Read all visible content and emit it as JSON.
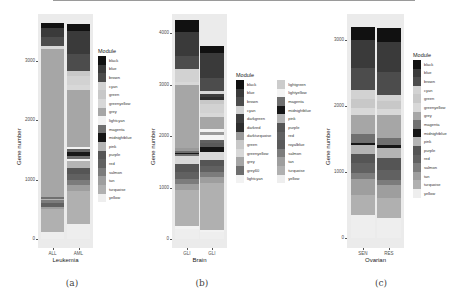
{
  "colors": {
    "black": "#111111",
    "blue": "#3a3a3a",
    "brown": "#4c4c4c",
    "cyan": "#d2d2d2",
    "darkgreen": "#3e3e3e",
    "darkred": "#2e2e2e",
    "darkturquoise": "#9a9a9a",
    "green": "#c8c8c8",
    "greenyellow": "#d8d8d8",
    "grey": "#a6a6a6",
    "grey60": "#6e6e6e",
    "lightcyan": "#f2f2f2",
    "lightgreen": "#cccccc",
    "lightyellow": "#f4f4f4",
    "magenta": "#707070",
    "midnightblue": "#161616",
    "pink": "#b4b4b4",
    "purple": "#555555",
    "red": "#616161",
    "royalblue": "#5a5a5a",
    "salmon": "#7c7c7c",
    "tan": "#9e9e9e",
    "turquoise": "#b0b0b0",
    "yellow": "#eeeeee"
  },
  "captions": [
    "(a)",
    "(b)",
    "(c)"
  ],
  "chart_data": [
    {
      "type": "bar",
      "stacked": true,
      "title": "",
      "xlabel": "Leukemia",
      "ylabel": "Gene number",
      "categories": [
        "ALL",
        "AML"
      ],
      "yticks": [
        0,
        1000,
        2000,
        3000
      ],
      "ylim": [
        -170,
        3800
      ],
      "legend_title": "Module",
      "legend": [
        "black",
        "blue",
        "brown",
        "cyan",
        "green",
        "greenyellow",
        "grey",
        "lightcyan",
        "magenta",
        "midnightblue",
        "pink",
        "purple",
        "red",
        "salmon",
        "tan",
        "turquoise",
        "yellow"
      ],
      "series_bottom_up": {
        "ALL": [
          {
            "module": "yellow",
            "value": 110
          },
          {
            "module": "turquoise",
            "value": 390
          },
          {
            "module": "tan",
            "value": 40
          },
          {
            "module": "red",
            "value": 70
          },
          {
            "module": "salmon",
            "value": 40
          },
          {
            "module": "pink",
            "value": 30
          },
          {
            "module": "magenta",
            "value": 20
          },
          {
            "module": "grey",
            "value": 2500
          },
          {
            "module": "greenyellow",
            "value": 50
          },
          {
            "module": "brown",
            "value": 150
          },
          {
            "module": "blue",
            "value": 150
          },
          {
            "module": "black",
            "value": 80
          }
        ],
        "AML": [
          {
            "module": "yellow",
            "value": 250
          },
          {
            "module": "turquoise",
            "value": 550
          },
          {
            "module": "tan",
            "value": 100
          },
          {
            "module": "salmon",
            "value": 100
          },
          {
            "module": "red",
            "value": 100
          },
          {
            "module": "purple",
            "value": 100
          },
          {
            "module": "pink",
            "value": 110
          },
          {
            "module": "lightcyan",
            "value": 30
          },
          {
            "module": "magenta",
            "value": 60
          },
          {
            "module": "midnightblue",
            "value": 60
          },
          {
            "module": "red",
            "value": 60
          },
          {
            "module": "lightcyan",
            "value": 30
          },
          {
            "module": "grey",
            "value": 950
          },
          {
            "module": "greenyellow",
            "value": 90
          },
          {
            "module": "cyan",
            "value": 150
          },
          {
            "module": "green",
            "value": 80
          },
          {
            "module": "brown",
            "value": 290
          },
          {
            "module": "blue",
            "value": 380
          },
          {
            "module": "black",
            "value": 130
          }
        ]
      }
    },
    {
      "type": "bar",
      "stacked": true,
      "title": "",
      "xlabel": "Brain",
      "ylabel": "Gene number",
      "categories": [
        "GLI",
        "GLI"
      ],
      "yticks": [
        0,
        1000,
        2000,
        3000,
        4000
      ],
      "ylim": [
        -120,
        4450
      ],
      "legend_title": "Module",
      "legend": [
        "black",
        "blue",
        "brown",
        "cyan",
        "darkgreen",
        "darkred",
        "darkturquoise",
        "green",
        "greenyellow",
        "grey",
        "grey60",
        "lightcyan",
        "lightgreen",
        "lightyellow",
        "magenta",
        "midnightblue",
        "pink",
        "purple",
        "red",
        "royalblue",
        "salmon",
        "tan",
        "turquoise",
        "yellow"
      ],
      "series_bottom_up": {
        "GLI_1": [
          {
            "module": "yellow",
            "value": 200
          },
          {
            "module": "lightcyan",
            "value": 60
          },
          {
            "module": "turquoise",
            "value": 700
          },
          {
            "module": "tan",
            "value": 100
          },
          {
            "module": "salmon",
            "value": 100
          },
          {
            "module": "red",
            "value": 150
          },
          {
            "module": "purple",
            "value": 150
          },
          {
            "module": "greenyellow",
            "value": 150
          },
          {
            "module": "magenta",
            "value": 40
          },
          {
            "module": "midnightblue",
            "value": 30
          },
          {
            "module": "grey60",
            "value": 40
          },
          {
            "module": "darkturquoise",
            "value": 50
          },
          {
            "module": "grey",
            "value": 1230
          },
          {
            "module": "greenyellow",
            "value": 60
          },
          {
            "module": "cyan",
            "value": 250
          },
          {
            "module": "brown",
            "value": 250
          },
          {
            "module": "blue",
            "value": 470
          },
          {
            "module": "black",
            "value": 220
          }
        ],
        "GLI_2": [
          {
            "module": "yellow",
            "value": 140
          },
          {
            "module": "lightcyan",
            "value": 40
          },
          {
            "module": "turquoise",
            "value": 900
          },
          {
            "module": "tan",
            "value": 120
          },
          {
            "module": "salmon",
            "value": 100
          },
          {
            "module": "red",
            "value": 120
          },
          {
            "module": "purple",
            "value": 120
          },
          {
            "module": "greenyellow",
            "value": 160
          },
          {
            "module": "midnightblue",
            "value": 80
          },
          {
            "module": "royalblue",
            "value": 80
          },
          {
            "module": "red",
            "value": 60
          },
          {
            "module": "lightyellow",
            "value": 100
          },
          {
            "module": "darkturquoise",
            "value": 60
          },
          {
            "module": "lightcyan",
            "value": 60
          },
          {
            "module": "grey",
            "value": 230
          },
          {
            "module": "greenyellow",
            "value": 80
          },
          {
            "module": "cyan",
            "value": 170
          },
          {
            "module": "green",
            "value": 90
          },
          {
            "module": "darkred",
            "value": 60
          },
          {
            "module": "darkgreen",
            "value": 50
          },
          {
            "module": "greenyellow",
            "value": 60
          },
          {
            "module": "brown",
            "value": 250
          },
          {
            "module": "blue",
            "value": 480
          },
          {
            "module": "black",
            "value": 150
          }
        ]
      }
    },
    {
      "type": "bar",
      "stacked": true,
      "title": "",
      "xlabel": "Ovarian",
      "ylabel": "Gene number",
      "categories": [
        "SEN",
        "RES"
      ],
      "yticks": [
        0,
        1000,
        2000,
        3000
      ],
      "ylim": [
        -110,
        3250
      ],
      "legend_title": "Module",
      "legend": [
        "black",
        "blue",
        "brown",
        "cyan",
        "green",
        "greenyellow",
        "grey",
        "magenta",
        "midnightblue",
        "pink",
        "purple",
        "red",
        "salmon",
        "tan",
        "turquoise",
        "yellow"
      ],
      "series_bottom_up": {
        "SEN": [
          {
            "module": "yellow",
            "value": 350
          },
          {
            "module": "turquoise",
            "value": 300
          },
          {
            "module": "tan",
            "value": 250
          },
          {
            "module": "salmon",
            "value": 80
          },
          {
            "module": "red",
            "value": 150
          },
          {
            "module": "purple",
            "value": 150
          },
          {
            "module": "pink",
            "value": 130
          },
          {
            "module": "midnightblue",
            "value": 30
          },
          {
            "module": "grey60",
            "value": 20
          },
          {
            "module": "magenta",
            "value": 110
          },
          {
            "module": "grey",
            "value": 300
          },
          {
            "module": "greenyellow",
            "value": 100
          },
          {
            "module": "green",
            "value": 130
          },
          {
            "module": "cyan",
            "value": 150
          },
          {
            "module": "brown",
            "value": 330
          },
          {
            "module": "blue",
            "value": 420
          },
          {
            "module": "black",
            "value": 200
          }
        ],
        "RES": [
          {
            "module": "yellow",
            "value": 300
          },
          {
            "module": "turquoise",
            "value": 300
          },
          {
            "module": "tan",
            "value": 200
          },
          {
            "module": "salmon",
            "value": 80
          },
          {
            "module": "red",
            "value": 150
          },
          {
            "module": "purple",
            "value": 190
          },
          {
            "module": "pink",
            "value": 150
          },
          {
            "module": "midnightblue",
            "value": 40
          },
          {
            "module": "magenta",
            "value": 110
          },
          {
            "module": "grey",
            "value": 340
          },
          {
            "module": "greenyellow",
            "value": 90
          },
          {
            "module": "green",
            "value": 120
          },
          {
            "module": "cyan",
            "value": 100
          },
          {
            "module": "brown",
            "value": 350
          },
          {
            "module": "blue",
            "value": 450
          },
          {
            "module": "black",
            "value": 220
          }
        ]
      }
    }
  ]
}
